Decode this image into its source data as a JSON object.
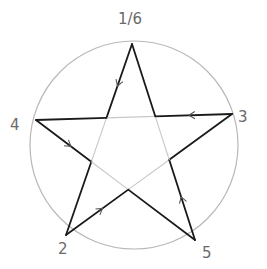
{
  "diagram": {
    "type": "pentagram-in-circle",
    "circle": {
      "cx": 134,
      "cy": 145,
      "r": 104,
      "stroke": "#b0b0b0"
    },
    "star_stroke": "#1a1a1a",
    "inner_stroke": "#c8c8c8",
    "vertices": [
      {
        "id": "v1",
        "label": "1/6",
        "x": 132,
        "y": 44,
        "label_x": 118,
        "label_y": 24
      },
      {
        "id": "v2",
        "label": "2",
        "x": 66,
        "y": 235,
        "label_x": 58,
        "label_y": 252
      },
      {
        "id": "v3",
        "label": "3",
        "x": 232,
        "y": 114,
        "label_x": 240,
        "label_y": 124
      },
      {
        "id": "v4",
        "label": "4",
        "x": 36,
        "y": 120,
        "label_x": 14,
        "label_y": 130
      },
      {
        "id": "v5",
        "label": "5",
        "x": 195,
        "y": 240,
        "label_x": 203,
        "label_y": 257
      }
    ],
    "edges": [
      {
        "from": "1",
        "to": "2",
        "arrow_at": 0.22
      },
      {
        "from": "2",
        "to": "3",
        "arrow_at": 0.22
      },
      {
        "from": "3",
        "to": "4",
        "arrow_at": 0.22
      },
      {
        "from": "4",
        "to": "5",
        "arrow_at": 0.22
      },
      {
        "from": "5",
        "to": "1",
        "arrow_at": 0.22
      }
    ]
  }
}
